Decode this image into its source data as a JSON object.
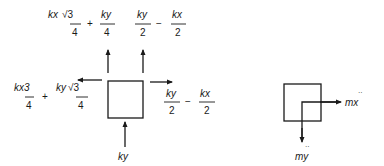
{
  "diagram": {
    "left_block": {
      "top_left_force": {
        "numerator_a": "kx",
        "radical": "√3",
        "denominator_a": "4",
        "operator": "+",
        "numerator_b": "ky",
        "denominator_b": "4"
      },
      "top_right_force": {
        "numerator_a": "ky",
        "denominator_a": "2",
        "operator": "−",
        "numerator_b": "kx",
        "denominator_b": "2"
      },
      "left_force": {
        "numerator_a": "kx3",
        "denominator_a": "4",
        "operator": "+",
        "numerator_b": "ky",
        "radical": "√3",
        "denominator_b": "4"
      },
      "right_force": {
        "numerator_a": "ky",
        "denominator_a": "2",
        "operator": "−",
        "numerator_b": "kx",
        "denominator_b": "2"
      },
      "bottom_force": {
        "label": "ky"
      }
    },
    "right_block": {
      "horizontal_inertia": {
        "label": "mx",
        "accent": "··"
      },
      "vertical_inertia": {
        "label": "my",
        "accent": "··"
      }
    }
  }
}
